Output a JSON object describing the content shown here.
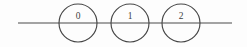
{
  "figure": {
    "type": "number-line-with-nodes",
    "background_color": "#fdfdfd",
    "stroke_color": "#464646",
    "line_color": "#4a4a4a",
    "label_color": "#3d3d3d",
    "axis": {
      "label": "horizontal-line",
      "x_start": 18,
      "x_end": 232,
      "y": 23
    },
    "nodes": [
      {
        "label": "0",
        "cx": 78,
        "cy": 23,
        "r": 19
      },
      {
        "label": "1",
        "cx": 130,
        "cy": 23,
        "r": 19
      },
      {
        "label": "2",
        "cx": 181,
        "cy": 23,
        "r": 19
      }
    ]
  }
}
